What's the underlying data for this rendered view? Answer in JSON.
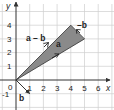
{
  "figure": {
    "axes": {
      "x_label": "x",
      "y_label": "y",
      "x_ticks": [
        "0",
        "1",
        "2",
        "3",
        "4",
        "5",
        "6"
      ],
      "y_ticks": [
        "-1",
        "1",
        "2",
        "3",
        "4"
      ],
      "xlim": [
        -1,
        7
      ],
      "ylim": [
        -1.5,
        4.8
      ],
      "grid": true
    },
    "vectors": [
      {
        "label": "a",
        "from": [
          0,
          0
        ],
        "to": [
          5,
          3
        ]
      },
      {
        "label": "a – b",
        "from": [
          0,
          0
        ],
        "to": [
          4,
          4
        ]
      },
      {
        "label": "–b",
        "from": [
          5,
          3
        ],
        "to": [
          4,
          4
        ]
      },
      {
        "label": "b",
        "from": [
          0,
          0
        ],
        "to": [
          1,
          -1
        ]
      }
    ],
    "shaded_triangle": [
      [
        0,
        0
      ],
      [
        4,
        4
      ],
      [
        5,
        3
      ]
    ],
    "colors": {
      "grid": "#c8c8c8",
      "axes": "#333333",
      "triangle_fill": "#8a8a8a",
      "triangle_stroke": "#333333"
    }
  },
  "labels": {
    "x_axis": "x",
    "y_axis": "y",
    "t0": "0",
    "t1": "1",
    "t2": "2",
    "t3": "3",
    "t4": "4",
    "t5": "5",
    "t6": "6",
    "ty1": "1",
    "ty2": "2",
    "ty3": "3",
    "ty4": "4",
    "tym1": "-1",
    "vec_a": "a",
    "vec_a_minus_b": "a – b",
    "vec_neg_b": "–b",
    "vec_b": "b"
  }
}
